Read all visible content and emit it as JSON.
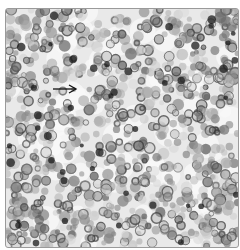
{
  "figure": {
    "caption_partial": "",
    "annotation": {
      "type": "arrow",
      "direction": "right",
      "color": "#111111"
    },
    "colors": {
      "background": "#ffffff",
      "frame_border": "#9a9a9a",
      "tissue_base": "#e9e9e9"
    }
  }
}
